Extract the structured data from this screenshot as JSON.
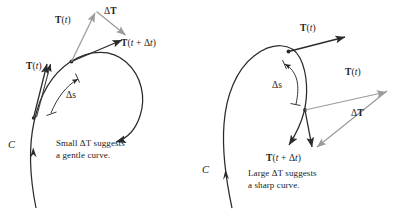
{
  "figure": {
    "background_color": "#ffffff",
    "stroke_color": "#2b2b2b",
    "vector_gray": "#9a9a9a",
    "vector_dark": "#333333"
  },
  "panels": [
    {
      "id": "left",
      "curve_label": "C",
      "caption_line1": "Small ΔT suggests",
      "caption_line2": "a gentle curve.",
      "arc_label": "Δs",
      "labels": {
        "tangent_at_t_on_curve": {
          "bold": "T",
          "rest": "(",
          "italic": "t",
          "close": ")"
        },
        "tangent_at_t_translated": {
          "bold": "T",
          "rest": "(",
          "italic": "t",
          "close": ")"
        },
        "tangent_at_t_plus_dt": {
          "bold": "T",
          "open": "(",
          "italic1": "t",
          "plus": " + ",
          "delta": "Δ",
          "italic2": "t",
          "close": ")"
        },
        "delta_T": {
          "delta": "Δ",
          "bold": "T"
        }
      }
    },
    {
      "id": "right",
      "curve_label": "C",
      "caption_line1": "Large ΔT suggests",
      "caption_line2": "a sharp curve.",
      "arc_label": "Δs",
      "labels": {
        "tangent_at_t_on_curve": {
          "bold": "T",
          "rest": "(",
          "italic": "t",
          "close": ")"
        },
        "tangent_at_t_translated": {
          "bold": "T",
          "rest": "(",
          "italic": "t",
          "close": ")"
        },
        "tangent_at_t_plus_dt": {
          "bold": "T",
          "open": "(",
          "italic1": "t",
          "plus": " + ",
          "delta": "Δ",
          "italic2": "t",
          "close": ")"
        },
        "delta_T": {
          "delta": "Δ",
          "bold": "T"
        }
      }
    }
  ]
}
